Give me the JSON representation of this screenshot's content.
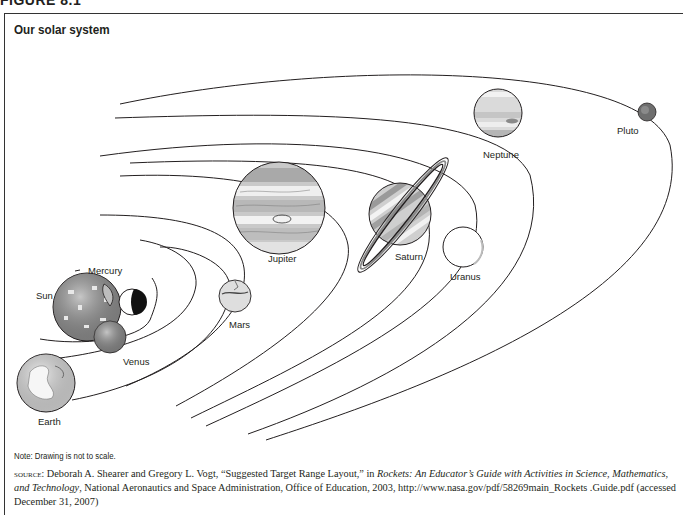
{
  "figure": {
    "label": "FIGURE 8.1",
    "title": "Our solar system"
  },
  "planets": [
    {
      "name": "Sun",
      "label": "Sun",
      "color": "#8f8f8f"
    },
    {
      "name": "Mercury",
      "label": "Mercury",
      "color": "#ffffff"
    },
    {
      "name": "Venus",
      "label": "Venus",
      "color": "#8a8a8a"
    },
    {
      "name": "Earth",
      "label": "Earth",
      "color": "#dcdcdc"
    },
    {
      "name": "Mars",
      "label": "Mars",
      "color": "#d8d8d8"
    },
    {
      "name": "Jupiter",
      "label": "Jupiter",
      "color": "#c9c9c9"
    },
    {
      "name": "Saturn",
      "label": "Saturn",
      "color": "#b5b5b5"
    },
    {
      "name": "Uranus",
      "label": "Uranus",
      "color": "#ffffff"
    },
    {
      "name": "Neptune",
      "label": "Neptune",
      "color": "#d0d0d0"
    },
    {
      "name": "Pluto",
      "label": "Pluto",
      "color": "#6e6e6e"
    }
  ],
  "note": "Note: Drawing is not to scale.",
  "source": {
    "prefix": "source:",
    "authors": " Deborah A. Shearer and Gregory L. Vogt, “Suggested Target Range Layout,” in ",
    "book": "Rockets: An Educator’s Guide with Activities in Science, Mathematics, and Technology",
    "rest": ", National Aeronautics and Space Administration, Office of Education, 2003, http://www.nasa.gov/pdf/58269main_Rockets .Guide.pdf (accessed December 31, 2007)"
  }
}
